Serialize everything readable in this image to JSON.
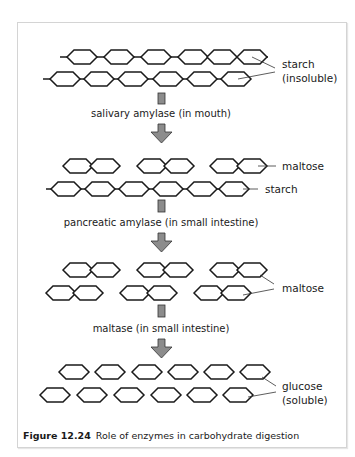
{
  "figure": {
    "number": "Figure 12.24",
    "caption": "Role of enzymes in carbohydrate digestion"
  },
  "stages": [
    {
      "name": "starch",
      "labels": [
        "starch",
        "(insoluble)"
      ]
    },
    {
      "name": "maltose-and-starch",
      "labels": [
        "maltose",
        "starch"
      ]
    },
    {
      "name": "maltose",
      "labels": [
        "maltose"
      ]
    },
    {
      "name": "glucose",
      "labels": [
        "glucose",
        "(soluble)"
      ]
    }
  ],
  "steps": [
    {
      "enzyme": "salivary amylase (in mouth)"
    },
    {
      "enzyme": "pancreatic amylase (in small intestine)"
    },
    {
      "enzyme": "maltase (in small intestine)"
    }
  ],
  "colors": {
    "arrow": "#8c8c8c",
    "line": "#1a1a1a",
    "frame": "#d4d4d4"
  }
}
